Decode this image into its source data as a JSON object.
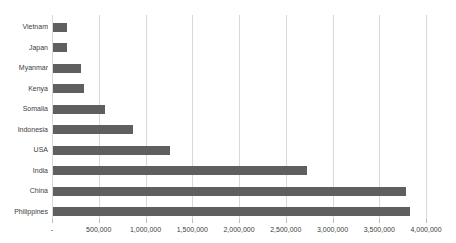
{
  "chart_data": {
    "type": "bar",
    "orientation": "horizontal",
    "title": "",
    "categories": [
      "Vietnam",
      "Japan",
      "Myanmar",
      "Kenya",
      "Somalia",
      "Indonesia",
      "USA",
      "India",
      "China",
      "Philippines"
    ],
    "values": [
      150000,
      160000,
      310000,
      340000,
      560000,
      860000,
      1260000,
      2720000,
      3780000,
      3820000
    ],
    "xlim": [
      0,
      4000000
    ],
    "x_tick_interval": 500000,
    "x_tick_labels": [
      "-",
      "500,000",
      "1,000,000",
      "1,500,000",
      "2,000,000",
      "2,500,000",
      "3,000,000",
      "3,500,000",
      "4,000,000"
    ],
    "grid": true,
    "legend": false,
    "colors": {
      "bar": "#5f5f5f",
      "gridline": "#d9d9d9",
      "tick": "#bfbfbf",
      "label": "#404040",
      "background": "#ffffff"
    }
  }
}
